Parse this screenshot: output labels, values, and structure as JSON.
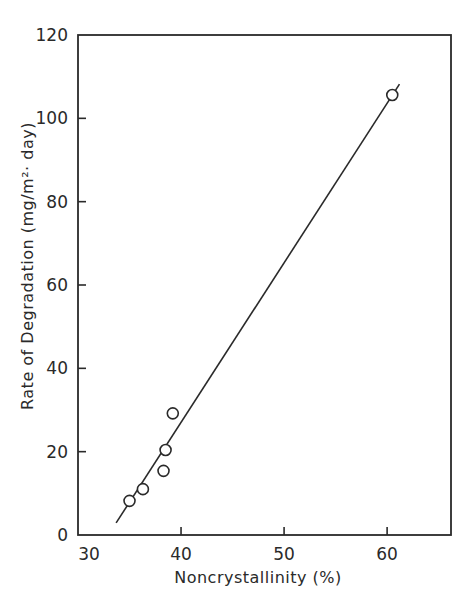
{
  "chart_data": {
    "type": "scatter",
    "title": "",
    "xlabel": "Noncrystallinity (%)",
    "ylabel": "Rate of Degradation (mg/m²· day)",
    "xlim": [
      30,
      66.2
    ],
    "ylim": [
      0,
      120
    ],
    "xticks": [
      30,
      40,
      50,
      60
    ],
    "yticks": [
      0,
      20,
      40,
      60,
      80,
      100,
      120
    ],
    "grid": false,
    "legend": null,
    "series": [
      {
        "name": "measured",
        "marker": "open-circle",
        "points": [
          {
            "x": 35.0,
            "y": 8.2
          },
          {
            "x": 36.3,
            "y": 11.0
          },
          {
            "x": 38.3,
            "y": 15.4
          },
          {
            "x": 38.5,
            "y": 20.4
          },
          {
            "x": 39.2,
            "y": 29.2
          },
          {
            "x": 60.5,
            "y": 105.6
          }
        ]
      },
      {
        "name": "linear fit",
        "type": "line",
        "points": [
          {
            "x": 33.7,
            "y": 2.9
          },
          {
            "x": 61.2,
            "y": 108.2
          }
        ]
      }
    ]
  },
  "layout": {
    "plot_left": 78,
    "plot_right": 451,
    "plot_top": 35,
    "plot_bottom": 535
  },
  "colors": {
    "ink": "#2a2a2a",
    "background": "#ffffff"
  }
}
